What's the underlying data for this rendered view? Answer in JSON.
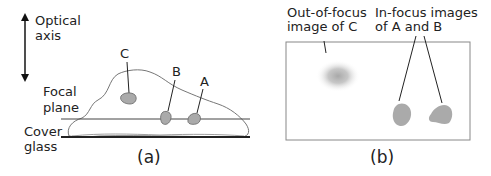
{
  "panel_a": {
    "axis_label_line1": "Optical",
    "axis_label_line2": "axis",
    "focal_label_line1": "Focal",
    "focal_label_line2": "plane",
    "cover_label_line1": "Cover",
    "cover_label_line2": "glass",
    "object_c": "C",
    "object_b": "B",
    "object_a": "A",
    "caption": "(a)"
  },
  "panel_b": {
    "out_label_line1": "Out-of-focus",
    "out_label_line2": "image of C",
    "in_label_line1": "In-focus images",
    "in_label_line2": "of A and B",
    "caption": "(b)"
  },
  "colors": {
    "line": "#333333",
    "blob_fill": "#aaaaaa",
    "blob_stroke": "#666666",
    "frame": "#888888"
  }
}
